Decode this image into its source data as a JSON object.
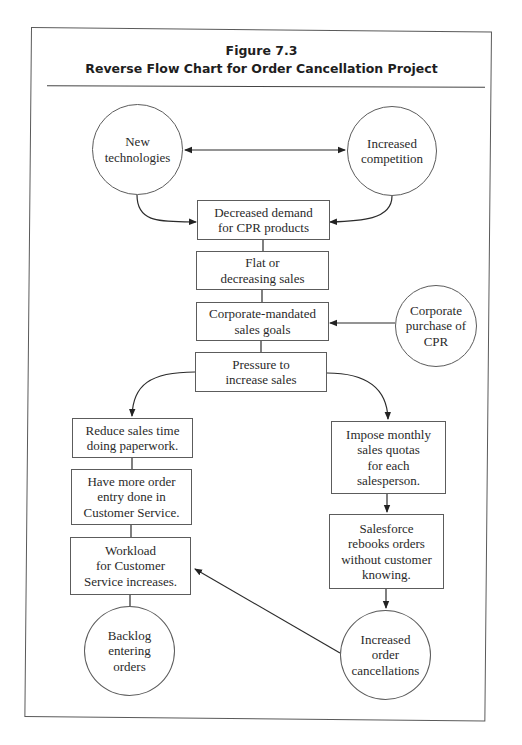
{
  "figure": {
    "number": "Figure 7.3",
    "title": "Reverse Flow Chart for Order Cancellation Project"
  },
  "colors": {
    "line": "#2b2b2b",
    "border": "#5c5c5c",
    "text": "#2a2a2a",
    "background": "#ffffff"
  },
  "nodes": {
    "new_tech": {
      "shape": "circle",
      "text": "New\ntechnologies"
    },
    "competition": {
      "shape": "circle",
      "text": "Increased\ncompetition"
    },
    "demand": {
      "shape": "box",
      "text": "Decreased demand\nfor CPR products"
    },
    "flat_sales": {
      "shape": "box",
      "text": "Flat or\ndecreasing sales"
    },
    "goals": {
      "shape": "box",
      "text": "Corporate-mandated\nsales goals"
    },
    "purchase": {
      "shape": "circle",
      "text": "Corporate\npurchase of\nCPR"
    },
    "pressure": {
      "shape": "box",
      "text": "Pressure to\nincrease sales"
    },
    "reduce": {
      "shape": "box",
      "text": "Reduce sales time\ndoing paperwork."
    },
    "order_entry": {
      "shape": "box",
      "text": "Have more order\nentry done in\nCustomer Service."
    },
    "workload": {
      "shape": "box",
      "text": "Workload\nfor Customer\nService increases."
    },
    "backlog": {
      "shape": "circle",
      "text": "Backlog\nentering\norders"
    },
    "quotas": {
      "shape": "box",
      "text": "Impose monthly\nsales quotas\nfor each\nsalesperson."
    },
    "rebooks": {
      "shape": "box",
      "text": "Salesforce\nrebooks orders\nwithout customer\nknowing."
    },
    "cancellations": {
      "shape": "circle",
      "text": "Increased\norder\ncancellations"
    }
  },
  "edges": [
    {
      "from": "new_tech",
      "to": "competition",
      "type": "bidirectional-arrow"
    },
    {
      "from": "new_tech",
      "to": "demand",
      "type": "curved-arrow"
    },
    {
      "from": "competition",
      "to": "demand",
      "type": "curved-arrow"
    },
    {
      "from": "demand",
      "to": "flat_sales",
      "type": "line"
    },
    {
      "from": "flat_sales",
      "to": "goals",
      "type": "line"
    },
    {
      "from": "purchase",
      "to": "goals",
      "type": "arrow"
    },
    {
      "from": "goals",
      "to": "pressure",
      "type": "line"
    },
    {
      "from": "pressure",
      "to": "reduce",
      "type": "curved-arrow"
    },
    {
      "from": "pressure",
      "to": "quotas",
      "type": "curved-arrow"
    },
    {
      "from": "reduce",
      "to": "order_entry",
      "type": "line"
    },
    {
      "from": "order_entry",
      "to": "workload",
      "type": "line"
    },
    {
      "from": "workload",
      "to": "backlog",
      "type": "line"
    },
    {
      "from": "quotas",
      "to": "rebooks",
      "type": "arrow"
    },
    {
      "from": "rebooks",
      "to": "cancellations",
      "type": "arrow"
    },
    {
      "from": "cancellations",
      "to": "workload",
      "type": "arrow"
    }
  ]
}
